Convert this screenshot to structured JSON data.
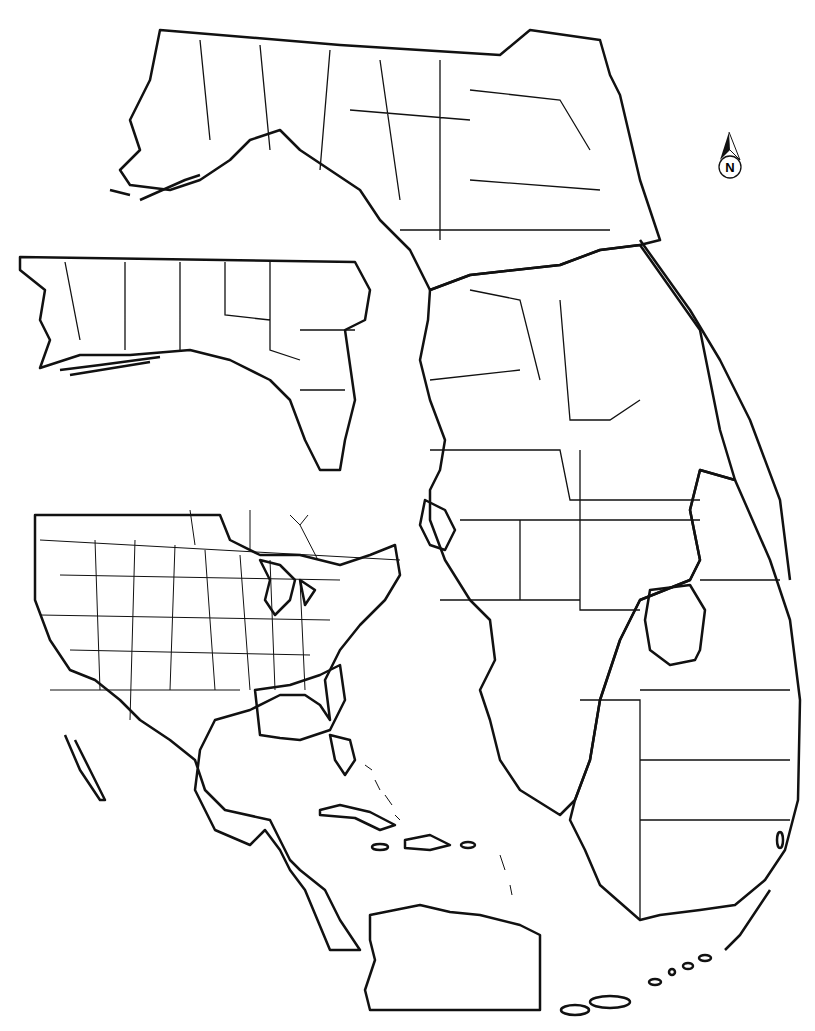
{
  "map": {
    "title": "",
    "north_arrow": {
      "label": "N",
      "icon": "north-arrow-icon"
    },
    "colors": {
      "ink": "#111111",
      "background": "#ffffff"
    },
    "zones": [
      {
        "id": "dense",
        "pattern": "cross-hatch",
        "regions": [
          "Florida Panhandle",
          "North Florida",
          "Northeast Florida coast",
          "Southeastern United States (GA, SC, AL, MS)"
        ]
      },
      {
        "id": "range",
        "pattern": "diagonal-hatch",
        "regions": [
          "Central Florida",
          "Southwest Florida coast",
          "Contiguous United States",
          "Mexico",
          "Central America",
          "Northern South America"
        ]
      },
      {
        "id": "absent",
        "pattern": "none",
        "regions": [
          "Southeast Florida",
          "Lake Okeechobee",
          "Florida Keys",
          "Caribbean islands"
        ]
      }
    ],
    "panels": [
      {
        "name": "florida-main",
        "label": "Florida"
      },
      {
        "name": "panhandle-inset",
        "label": "Western Panhandle"
      },
      {
        "name": "americas-inset",
        "label": "North & Central America"
      }
    ]
  }
}
